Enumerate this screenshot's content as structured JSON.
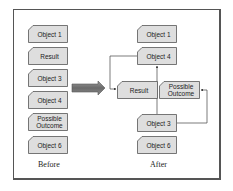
{
  "diagram": {
    "before": {
      "label": "Before",
      "items": [
        {
          "label": "Object 1"
        },
        {
          "label": "Result"
        },
        {
          "label": "Object 3"
        },
        {
          "label": "Object 4"
        },
        {
          "label": "Possible Outcome"
        },
        {
          "label": "Object 6"
        }
      ]
    },
    "after": {
      "label": "After",
      "items": [
        {
          "label": "Object 1"
        },
        {
          "label": "Object 4"
        },
        {
          "label": "Result"
        },
        {
          "label": "Possible Outcome"
        },
        {
          "label": "Object 3"
        },
        {
          "label": "Object 6"
        }
      ]
    },
    "connections": [
      {
        "from": "Object 4",
        "to": "Result"
      },
      {
        "from": "Object 3",
        "to": "Object 4"
      },
      {
        "from": "Object 3",
        "to": "Possible Outcome"
      }
    ],
    "colors": {
      "box_fill": "#dedede",
      "box_border": "#555555",
      "arrow_fill": "#777777",
      "line": "#444444"
    }
  }
}
